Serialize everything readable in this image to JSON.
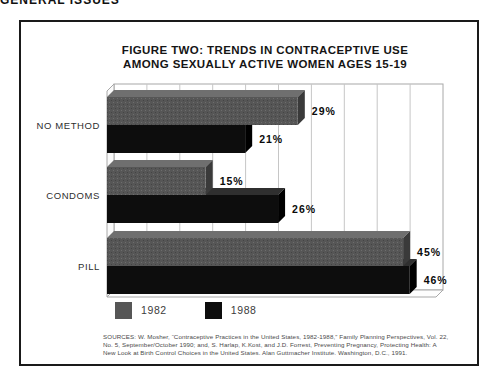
{
  "page": {
    "header": "GENERAL ISSUES"
  },
  "figure": {
    "title_line1": "FIGURE TWO: TRENDS IN CONTRACEPTIVE USE",
    "title_line2": "AMONG SEXUALLY ACTIVE WOMEN AGES 15-19",
    "source_line1": "SOURCES: W. Mosher, “Contraceptive Practices in the United States, 1982-1988,” Family Planning Perspectives, Vol. 22,",
    "source_line2": "No. 5, September/October 1990; and, S. Harlap, K.Kost, and J.D. Forrest, Preventing Pregnancy, Protecting Health: A",
    "source_line3": "New Look at Birth Control Choices in the United States. Alan Guttmacher Institute. Washington, D.C., 1991."
  },
  "chart_data": {
    "type": "bar",
    "orientation": "horizontal",
    "title": "FIGURE TWO: TRENDS IN CONTRACEPTIVE USE AMONG SEXUALLY ACTIVE WOMEN AGES 15-19",
    "categories": [
      "NO METHOD",
      "CONDOMS",
      "PILL"
    ],
    "series": [
      {
        "name": "1982",
        "color": "#565656",
        "values": [
          29,
          15,
          45
        ]
      },
      {
        "name": "1988",
        "color": "#0d0d0d",
        "values": [
          21,
          26,
          46
        ]
      }
    ],
    "value_label_suffix": "%",
    "xlim": [
      0,
      50
    ],
    "gridline_step": 5,
    "grid": true,
    "legend_position": "bottom",
    "colors": {
      "grid_line": "#c6c6c6",
      "wall_edge": "#a8a8a8",
      "label_text": "#2e2e2e",
      "value_text": "#0a0a0a",
      "bar1982_top": "#6f6f6f",
      "bar1982_side": "#3a3a3a",
      "bar1988_top": "#2f2f2f",
      "bar1988_side": "#000000"
    }
  }
}
